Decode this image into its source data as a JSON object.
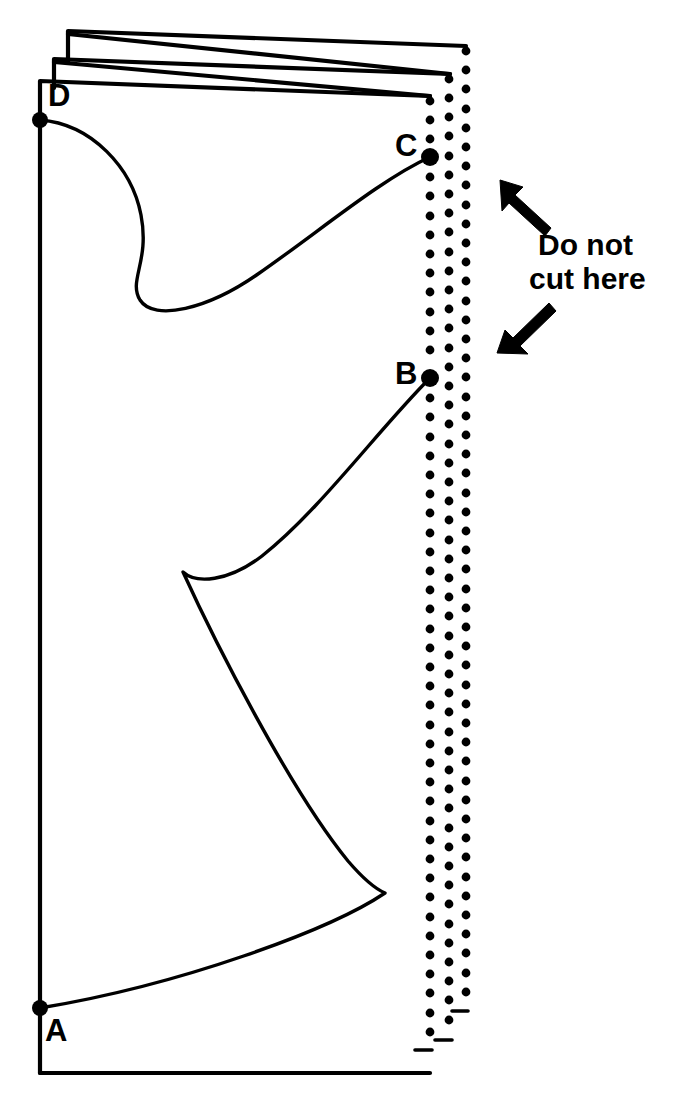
{
  "figure": {
    "name": "folded-paper-cutting-diagram",
    "background_color": "#ffffff",
    "ink_color": "#000000",
    "width": 677,
    "height": 1114
  },
  "annotations": {
    "caption": {
      "line1": "Do not",
      "line2": "cut here",
      "full_text": "Do not cut here",
      "x": 538,
      "y": 228,
      "font_size": 30,
      "bold": true
    },
    "arrows": [
      {
        "name": "arrow-upper-left",
        "direction": "up-left",
        "tail_x": 549,
        "tail_y": 232,
        "tip_x": 500,
        "tip_y": 180
      },
      {
        "name": "arrow-lower-left",
        "direction": "down-left",
        "tail_x": 553,
        "tail_y": 306,
        "tip_x": 497,
        "tip_y": 353
      }
    ]
  },
  "points": [
    {
      "id": "A",
      "label": "A",
      "x": 40,
      "y": 1008,
      "label_x": 45,
      "label_y": 1015,
      "radius": 8
    },
    {
      "id": "B",
      "label": "B",
      "x": 430,
      "y": 378,
      "label_x": 395,
      "label_y": 358,
      "radius": 9
    },
    {
      "id": "C",
      "label": "C",
      "x": 430,
      "y": 157,
      "label_x": 395,
      "label_y": 130,
      "radius": 9
    },
    {
      "id": "D",
      "label": "D",
      "x": 40,
      "y": 120,
      "label_x": 48,
      "label_y": 80,
      "radius": 8
    }
  ],
  "sheets": [
    {
      "name": "sheet-back",
      "order": 3,
      "fold_x": 68,
      "top_left_y": 31,
      "top_right_y": 46,
      "right_x": 466,
      "spine_drop_y": 62
    },
    {
      "name": "sheet-middle",
      "order": 2,
      "fold_x": 54,
      "top_left_y": 59,
      "top_right_y": 74,
      "right_x": 450,
      "spine_drop_y": 88
    },
    {
      "name": "sheet-front",
      "order": 1,
      "fold_x": 40,
      "top_left_y": 81,
      "top_right_y": 96,
      "right_x": 430,
      "bottom_y": 1073
    }
  ],
  "perforation": {
    "description": "three vertical columns of dots marking the folded spine edge",
    "dot_radius": 4.6,
    "spacing_y": 19.2,
    "columns": [
      {
        "name": "perf-column-inner",
        "x": 430,
        "y_start": 82,
        "y_end": 1050
      },
      {
        "name": "perf-column-middle",
        "x": 449,
        "y_start": 60,
        "y_end": 1040
      },
      {
        "name": "perf-column-outer",
        "x": 466,
        "y_start": 32,
        "y_end": 1022
      }
    ]
  },
  "cut_lines": [
    {
      "name": "cut-curve-d-to-c",
      "from": "D",
      "to": "C",
      "description": "S-shaped curve from D sweeping right, dipping down and rising to C",
      "path": "M 40 120 C 92 124 132 168 141 215 C 150 262 128 280 140 300 C 154 322 208 309 258 274 C 320 231 380 180 430 157"
    },
    {
      "name": "cut-curve-b-to-a",
      "from": "B",
      "to": "A",
      "description": "curve descending from B to a cusp, sweeping out to the right and returning to A",
      "path": "M 430 378 C 378 430 320 510 262 556 C 228 582 196 584 183 572 C 214 640 290 790 348 861 C 366 882 378 890 385 893 C 330 930 180 985 40 1008"
    }
  ]
}
